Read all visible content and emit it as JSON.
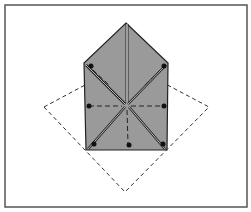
{
  "diagram": {
    "type": "origami-fold-step",
    "colors": {
      "background": "#ffffff",
      "frame": "#555555",
      "paper": "#9a9a9a",
      "line": "#222222",
      "crease_highlight": "#e6e6e6"
    },
    "frame": {
      "x": 5,
      "y": 5,
      "w": 242,
      "h": 202
    },
    "paper_pentagon": "126,23 168,63 167,150 86,150 84,63",
    "dashed_square": "44,107 126,63 209,107 125,192",
    "center": {
      "x": 126,
      "y": 105
    },
    "dots": [
      {
        "x": 91,
        "y": 66
      },
      {
        "x": 164,
        "y": 66
      },
      {
        "x": 89,
        "y": 106
      },
      {
        "x": 164,
        "y": 106
      },
      {
        "x": 94,
        "y": 144
      },
      {
        "x": 163,
        "y": 144
      },
      {
        "x": 129,
        "y": 145
      }
    ]
  }
}
